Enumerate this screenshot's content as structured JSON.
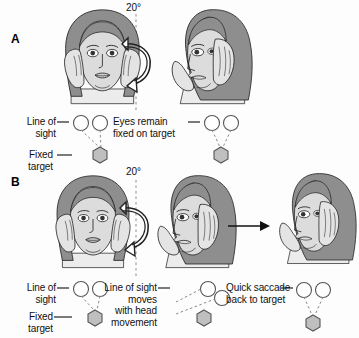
{
  "figure": {
    "background_color": "#fdfdfd",
    "ink_color": "#111111",
    "hair_color": "#8e8e8e",
    "skin_color": "#d8d8d8",
    "target_fill": "#bfbfbf",
    "eye_fill": "#ffffff"
  },
  "panels": [
    {
      "letter": "A",
      "rotation_label": "20°",
      "annotations": [
        {
          "name": "line-of-sight-left",
          "text": "Line of\nsight"
        },
        {
          "name": "fixed-target-left",
          "text": "Fixed\ntarget"
        },
        {
          "name": "eyes-remain-fixed",
          "text": "Eyes remain\nfixed on target"
        }
      ],
      "figures": [
        {
          "name": "head-frontal",
          "view": "frontal",
          "hands": "both-sides-of-head"
        },
        {
          "name": "head-rotated",
          "view": "three-quarter-right",
          "hands": "both-sides-of-head"
        }
      ],
      "arrows": [
        {
          "name": "rotation-arrow",
          "type": "curved",
          "direction": "counterclockwise"
        }
      ],
      "eye_groups": [
        {
          "name": "eyes-before-rotation",
          "gaze": "on-target"
        },
        {
          "name": "eyes-after-rotation",
          "gaze": "on-target"
        }
      ]
    },
    {
      "letter": "B",
      "rotation_label": "20°",
      "annotations": [
        {
          "name": "line-of-sight-left",
          "text": "Line of\nsight"
        },
        {
          "name": "fixed-target-left",
          "text": "Fixed\ntarget"
        },
        {
          "name": "line-of-sight-moves",
          "text": "Line of sight\nmoves\nwith head\nmovement"
        },
        {
          "name": "quick-saccade",
          "text": "Quick saccade\nback to target"
        }
      ],
      "figures": [
        {
          "name": "head-frontal",
          "view": "frontal",
          "hands": "both-sides-of-head"
        },
        {
          "name": "head-rotated",
          "view": "three-quarter-right",
          "hands": "both-sides-of-head"
        },
        {
          "name": "head-rotated-after-saccade",
          "view": "three-quarter-right",
          "hands": "both-sides-of-head"
        }
      ],
      "arrows": [
        {
          "name": "rotation-arrow",
          "type": "curved",
          "direction": "counterclockwise"
        },
        {
          "name": "saccade-arrow",
          "type": "straight",
          "direction": "right"
        }
      ],
      "eye_groups": [
        {
          "name": "eyes-before-rotation",
          "gaze": "on-target"
        },
        {
          "name": "eyes-dragged-with-head",
          "gaze": "off-target"
        },
        {
          "name": "eyes-after-saccade",
          "gaze": "on-target"
        }
      ]
    }
  ]
}
